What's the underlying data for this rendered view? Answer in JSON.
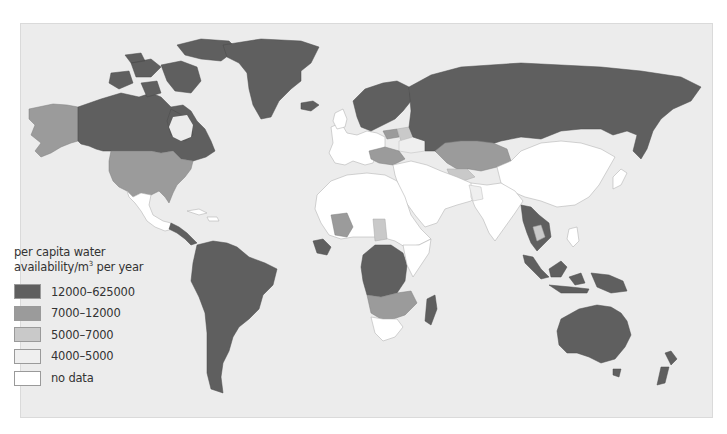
{
  "map": {
    "title": "per capita water availability",
    "legend": {
      "title_line1": "per capita water",
      "title_line2_prefix": "availability/m",
      "title_line2_sup": "3",
      "title_line2_suffix": " per year",
      "items": [
        {
          "label": "12000–625000",
          "color": "#5f5f5f"
        },
        {
          "label": "7000–12000",
          "color": "#9b9b9b"
        },
        {
          "label": "5000–7000",
          "color": "#c9c9c9"
        },
        {
          "label": "4000–5000",
          "color": "#efefef"
        },
        {
          "label": "no data",
          "color": "#ffffff"
        }
      ]
    },
    "ocean_color": "#ececec",
    "regions": {
      "12000-625000": [
        "Canada",
        "Greenland",
        "Iceland",
        "Norway",
        "Sweden",
        "Finland",
        "Russia",
        "Central America",
        "South America",
        "Guinea / Sierra Leone / Liberia",
        "Central Africa (Congo basin)",
        "Angola",
        "Madagascar",
        "Myanmar",
        "Laos / Vietnam",
        "Malaysia",
        "Indonesia",
        "Papua New Guinea",
        "Australia",
        "New Zealand"
      ],
      "7000-12000": [
        "USA",
        "Alaska",
        "Kazakhstan",
        "Mali",
        "Zambia",
        "Mozambique",
        "Namibia",
        "Botswana",
        "Baltic states",
        "Central Europe (Austria/Hungary/Romania)"
      ],
      "5000-7000": [
        "Belarus",
        "Turkmenistan",
        "Chad",
        "Thailand",
        "Iraq"
      ],
      "4000-5000": [
        "Ukraine",
        "Pakistan"
      ],
      "no data": [
        "China",
        "India",
        "Mexico",
        "Western Europe",
        "North Africa",
        "Middle East",
        "Southern Africa (South Africa)",
        "Japan",
        "East Africa"
      ]
    }
  }
}
